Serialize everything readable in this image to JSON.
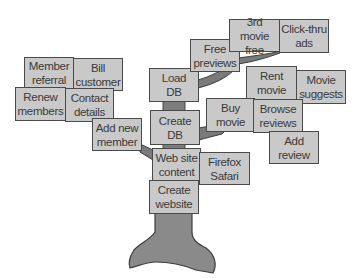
{
  "diagram": {
    "type": "tree",
    "colors": {
      "box_fill": "#c9c9c9",
      "box_border": "#4a4a4a",
      "text": "#3a3a3a",
      "trunk": "#8a8a8a",
      "branch": "#7a7a7a"
    },
    "trunk": {
      "root": "Create website",
      "stack": [
        "Create website",
        "Web site content",
        "Create DB",
        "Load DB"
      ]
    },
    "boxes": {
      "member_referral": "Member\nreferral",
      "bill_customer": "Bill\ncustomer",
      "renew_members": "Renew\nmembers",
      "contact_details": "Contact\ndetails",
      "add_new_member": "Add new\nmember",
      "load_db": "Load\nDB",
      "create_db": "Create\nDB",
      "web_site_content": "Web site\ncontent",
      "create_website": "Create\nwebsite",
      "firefox_safari": "Firefox\nSafari",
      "free_previews": "Free\npreviews",
      "third_movie_free": "3rd movie\nfree",
      "click_thru_ads": "Click-thru\nads",
      "rent_movie": "Rent\nmovie",
      "movie_suggests": "Movie\nsuggests",
      "buy_movie": "Buy\nmovie",
      "browse_reviews": "Browse\nreviews",
      "add_review": "Add\nreview"
    },
    "branches": [
      {
        "from": "Web site content",
        "to": "Add new member",
        "children": [
          "Renew members",
          "Contact details",
          "Member referral",
          "Bill customer"
        ]
      },
      {
        "from": "Create DB",
        "to": "Buy movie",
        "children": [
          "Browse reviews",
          "Add review",
          "Rent movie",
          "Movie suggests"
        ]
      },
      {
        "from": "Load DB",
        "to": "Free previews",
        "children": [
          "3rd movie free",
          "Click-thru ads"
        ]
      },
      {
        "from": "Web site content",
        "to": "Firefox Safari",
        "children": []
      }
    ]
  }
}
